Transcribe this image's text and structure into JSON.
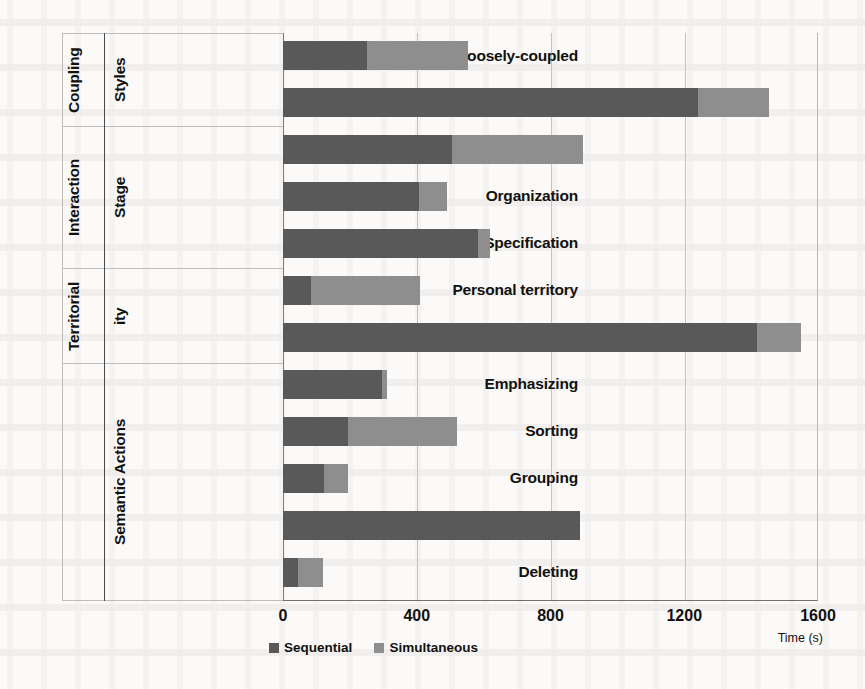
{
  "chart_data": {
    "type": "bar",
    "orientation": "horizontal",
    "stacked": true,
    "title": "",
    "xlabel": "Time (s)",
    "ylabel": "",
    "xlim": [
      0,
      1600
    ],
    "xticks": [
      "0",
      "400",
      "800",
      "1200",
      "1600"
    ],
    "grid": true,
    "legend_position": "bottom",
    "categories": [
      "Loosely-coupled",
      "Close-coupled",
      "Browsing",
      "Organization",
      "Specification",
      "Personal territory",
      "Group territory",
      "Emphasizing",
      "Sorting",
      "Grouping",
      "Linking",
      "Deleting"
    ],
    "series": [
      {
        "name": "Sequential",
        "color": "#595959",
        "values": [
          251,
          1242,
          506,
          407,
          583,
          84,
          1419,
          297,
          195,
          123,
          889,
          45
        ]
      },
      {
        "name": "Simultaneous",
        "color": "#8e8e8e",
        "values": [
          303,
          210,
          392,
          84,
          37,
          326,
          129,
          14,
          326,
          72,
          0,
          75
        ]
      }
    ],
    "totals": [
      554,
      1452,
      898,
      491,
      620,
      410,
      1548,
      311,
      521,
      195,
      889,
      120
    ],
    "groups": [
      {
        "name": "Coupling Styles",
        "lines": [
          "Coupling",
          "Styles"
        ],
        "categories": [
          "Loosely-coupled",
          "Close-coupled"
        ]
      },
      {
        "name": "Interaction Stage",
        "lines": [
          "Interaction",
          "Stage"
        ],
        "categories": [
          "Browsing",
          "Organization",
          "Specification"
        ]
      },
      {
        "name": "Territoriality",
        "lines": [
          "Territorial",
          "ity"
        ],
        "categories": [
          "Personal territory",
          "Group territory"
        ]
      },
      {
        "name": "Semantic Actions",
        "lines": [
          "Semantic Actions"
        ],
        "categories": [
          "Emphasizing",
          "Sorting",
          "Grouping",
          "Linking",
          "Deleting"
        ]
      }
    ]
  },
  "legend": {
    "items": [
      {
        "label": "Sequential",
        "color": "#595959"
      },
      {
        "label": "Simultaneous",
        "color": "#8e8e8e"
      }
    ]
  },
  "axis": {
    "x_title": "Time (s)",
    "ticks": [
      "0",
      "400",
      "800",
      "1200",
      "1600"
    ]
  },
  "labels": {
    "group_coupling_1": "Coupling",
    "group_coupling_2": "Styles",
    "group_interaction_1": "Interaction",
    "group_interaction_2": "Stage",
    "group_territorial_1": "Territorial",
    "group_territorial_2": "ity",
    "group_semantic": "Semantic Actions",
    "cat_0": "Loosely-coupled",
    "cat_1": "Close-coupled",
    "cat_2": "Browsing",
    "cat_3": "Organization",
    "cat_4": "Specification",
    "cat_5": "Personal territory",
    "cat_6": "Group territory",
    "cat_7": "Emphasizing",
    "cat_8": "Sorting",
    "cat_9": "Grouping",
    "cat_10": "Linking",
    "cat_11": "Deleting"
  }
}
